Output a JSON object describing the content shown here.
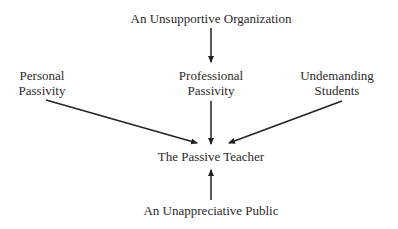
{
  "diagram": {
    "nodes": {
      "organization": {
        "label": "An Unsupportive Organization"
      },
      "personal": {
        "line1": "Personal",
        "line2": "Passivity"
      },
      "professional": {
        "line1": "Professional",
        "line2": "Passivity"
      },
      "students": {
        "line1": "Undemanding",
        "line2": "Students"
      },
      "teacher": {
        "label": "The Passive Teacher"
      },
      "public": {
        "label": "An Unappreciative Public"
      }
    },
    "edges": [
      {
        "from": "organization",
        "to": "professional"
      },
      {
        "from": "personal",
        "to": "teacher"
      },
      {
        "from": "professional",
        "to": "teacher"
      },
      {
        "from": "students",
        "to": "teacher"
      },
      {
        "from": "public",
        "to": "teacher"
      }
    ],
    "colors": {
      "line": "#222222",
      "text": "#2a2a2a",
      "background": "#ffffff"
    }
  }
}
